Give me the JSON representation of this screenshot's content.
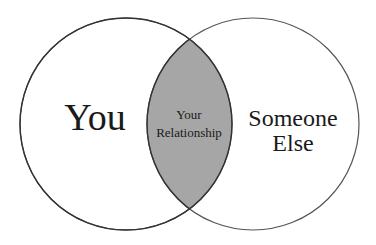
{
  "diagram": {
    "type": "venn",
    "sets": [
      {
        "label": "You"
      },
      {
        "label_line1": "Someone",
        "label_line2": "Else"
      }
    ],
    "intersection": {
      "label_line1": "Your",
      "label_line2": "Relationship"
    },
    "colors": {
      "intersection_fill": "#a6a6a6",
      "stroke": "#555555",
      "background": "#ffffff"
    }
  }
}
